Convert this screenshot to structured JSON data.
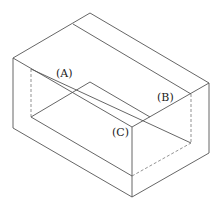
{
  "figure": {
    "labels": {
      "a": "(A)",
      "b": "(B)",
      "c": "(C)"
    },
    "line_color": "#555555"
  }
}
